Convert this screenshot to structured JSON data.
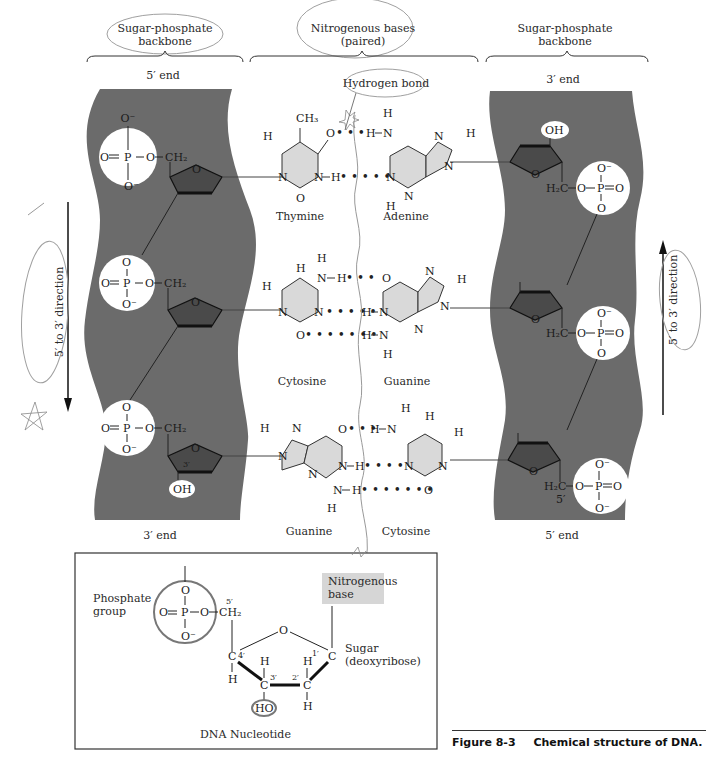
{
  "headers": {
    "left_backbone": "Sugar-phosphate backbone",
    "left_backbone_l1": "Sugar-phosphate",
    "left_backbone_l2": "backbone",
    "bases_l1": "Nitrogenous bases",
    "bases_l2": "(paired)",
    "right_backbone_l1": "Sugar-phosphate",
    "right_backbone_l2": "backbone",
    "hydrogen_bond": "Hydrogen bond"
  },
  "strand_ends": {
    "left_top": "5′ end",
    "left_bottom": "3′ end",
    "right_top": "3′ end",
    "right_bottom": "5′ end"
  },
  "direction_labels": {
    "left": "5′ to 3′ direction",
    "right": "5′ to 3′ direction"
  },
  "base_pairs": [
    {
      "left": "Thymine",
      "right": "Adenine",
      "h_bonds": 2
    },
    {
      "left": "Cytosine",
      "right": "Guanine",
      "h_bonds": 3
    },
    {
      "left": "Guanine",
      "right": "Cytosine",
      "h_bonds": 3
    }
  ],
  "chem": {
    "O": "O",
    "O_minus": "O⁻",
    "P": "P",
    "CH2": "CH₂",
    "H2C": "H₂C",
    "OH": "OH",
    "HO": "HO",
    "N": "N",
    "H": "H",
    "CH3": "CH₃",
    "C": "C",
    "prime3": "3′",
    "prime5": "5′",
    "prime1": "1′",
    "prime2": "2′",
    "prime4": "4′"
  },
  "inset": {
    "title": "DNA Nucleotide",
    "phosphate_l1": "Phosphate",
    "phosphate_l2": "group",
    "base_l1": "Nitrogenous",
    "base_l2": "base",
    "sugar_l1": "Sugar",
    "sugar_l2": "(deoxyribose)"
  },
  "caption": {
    "number": "Figure 8-3",
    "text": "Chemical structure of DNA."
  },
  "colors": {
    "backbone": "#6b6b6b",
    "phosphate_circle": "#ffffff",
    "sugar_ring": "#4a4a4a",
    "base_fill": "#d9d9d9",
    "inset_base_box": "#d6d6d6",
    "annotation_pencil": "#9a9a9a"
  }
}
